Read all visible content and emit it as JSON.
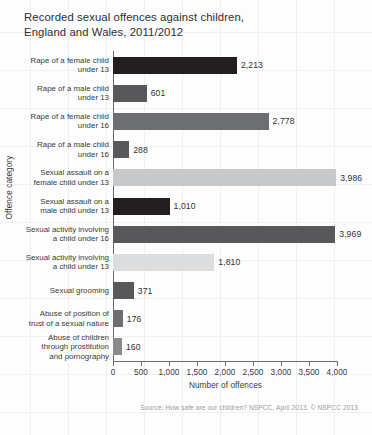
{
  "chart_data": {
    "type": "bar",
    "orientation": "horizontal",
    "title": "Recorded sexual offences against children,\nEngland and Wales, 2011/2012",
    "xlabel": "Number of offences",
    "ylabel": "Offence category",
    "xlim": [
      0,
      4000
    ],
    "grid": true,
    "legend": null,
    "source": "Source: How safe are our children? NSPCC, April 2013. © NSPCC 2013",
    "xticks": [
      0,
      500,
      1000,
      1500,
      2000,
      2500,
      3000,
      3500,
      4000
    ],
    "xtick_labels": [
      "0",
      "500",
      "1,000",
      "1,500",
      "2,000",
      "2,500",
      "3,000",
      "3,500",
      "4,000"
    ],
    "categories": [
      "Rape of a female child\nunder 13",
      "Rape of a male child\nunder 13",
      "Rape of a female child\nunder 16",
      "Rape of a male child\nunder 16",
      "Sexual assault on a\nfemale child under 13",
      "Sexual assault on a\nmale child under 13",
      "Sexual activity involving\na child under 16",
      "Sexual activity involving\na child under 13",
      "Sexual grooming",
      "Abuse of position of\ntrust of a sexual nature",
      "Abuse of children\nthrough prostitution\nand pornography"
    ],
    "values": [
      2213,
      601,
      2778,
      288,
      3986,
      1010,
      3969,
      1810,
      371,
      176,
      160
    ],
    "value_labels": [
      "2,213",
      "601",
      "2,778",
      "288",
      "3,986",
      "1,010",
      "3,969",
      "1,810",
      "371",
      "176",
      "160"
    ],
    "bar_colors": [
      "#231f20",
      "#58585b",
      "#6d6e71",
      "#58585b",
      "#c7c8ca",
      "#231f20",
      "#58585b",
      "#dcddde",
      "#58585b",
      "#6d6e71",
      "#8a8b8d"
    ]
  },
  "colors": {
    "background": "#fdfdfd",
    "grid": "#eceef0",
    "axis": "#6a6a6c",
    "text": "#3a3a3c",
    "source_text": "#9a9b9d"
  }
}
